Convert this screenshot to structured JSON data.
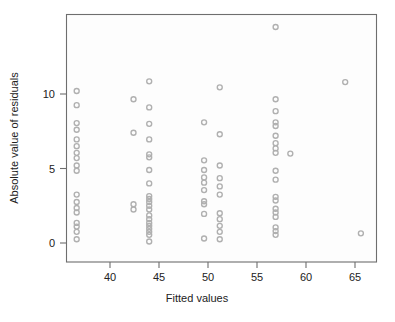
{
  "figure": {
    "title": "",
    "background_color": "#ffffff",
    "plot_background_color": "#fdfdfd",
    "frame_color": "#6e6e6e",
    "point_color": "#b0b0b0"
  },
  "axes": {
    "x_title": "Fitted values",
    "y_title": "Absolute value of residuals",
    "x_ticks": [
      "40",
      "45",
      "50",
      "55",
      "60",
      "65"
    ],
    "y_ticks": [
      "0",
      "5",
      "10"
    ]
  },
  "chart_data": {
    "type": "scatter",
    "title": "",
    "xlabel": "Fitted values",
    "ylabel": "Absolute value of residuals",
    "xticks": [
      40,
      45,
      50,
      55,
      60,
      65
    ],
    "yticks": [
      0,
      5,
      10
    ],
    "xlim": [
      35.8,
      67.6
    ],
    "ylim": [
      -0.6,
      15.0
    ],
    "grid": false,
    "legend": null,
    "marker": "open-circle",
    "marker_color": "#b0b0b0",
    "points": [
      [
        36.6,
        10.2
      ],
      [
        36.6,
        9.25
      ],
      [
        36.6,
        8.05
      ],
      [
        36.6,
        7.6
      ],
      [
        36.6,
        6.95
      ],
      [
        36.6,
        6.5
      ],
      [
        36.6,
        6.05
      ],
      [
        36.6,
        5.7
      ],
      [
        36.6,
        5.2
      ],
      [
        36.6,
        4.85
      ],
      [
        36.6,
        3.25
      ],
      [
        36.6,
        2.75
      ],
      [
        36.6,
        2.35
      ],
      [
        36.6,
        2.05
      ],
      [
        36.6,
        1.35
      ],
      [
        36.6,
        1.1
      ],
      [
        36.6,
        0.75
      ],
      [
        36.6,
        0.25
      ],
      [
        42.4,
        9.65
      ],
      [
        42.4,
        7.4
      ],
      [
        42.4,
        2.6
      ],
      [
        42.4,
        2.25
      ],
      [
        44.0,
        10.85
      ],
      [
        44.0,
        9.1
      ],
      [
        44.0,
        8.0
      ],
      [
        44.0,
        6.95
      ],
      [
        44.0,
        5.95
      ],
      [
        44.0,
        5.75
      ],
      [
        44.0,
        4.9
      ],
      [
        44.0,
        4.0
      ],
      [
        44.0,
        3.15
      ],
      [
        44.0,
        2.95
      ],
      [
        44.0,
        2.75
      ],
      [
        44.0,
        2.5
      ],
      [
        44.0,
        2.25
      ],
      [
        44.0,
        1.85
      ],
      [
        44.0,
        1.6
      ],
      [
        44.0,
        1.35
      ],
      [
        44.0,
        1.15
      ],
      [
        44.0,
        0.95
      ],
      [
        44.0,
        0.75
      ],
      [
        44.0,
        0.55
      ],
      [
        44.0,
        0.1
      ],
      [
        49.6,
        8.1
      ],
      [
        49.6,
        5.55
      ],
      [
        49.6,
        4.9
      ],
      [
        49.6,
        4.4
      ],
      [
        49.6,
        4.05
      ],
      [
        49.6,
        3.55
      ],
      [
        49.6,
        2.8
      ],
      [
        49.6,
        2.6
      ],
      [
        49.6,
        1.95
      ],
      [
        49.6,
        0.3
      ],
      [
        51.2,
        10.45
      ],
      [
        51.2,
        7.3
      ],
      [
        51.2,
        5.2
      ],
      [
        51.2,
        4.35
      ],
      [
        51.2,
        3.8
      ],
      [
        51.2,
        3.25
      ],
      [
        51.2,
        2.0
      ],
      [
        51.2,
        1.6
      ],
      [
        51.2,
        1.15
      ],
      [
        51.2,
        0.75
      ],
      [
        51.2,
        0.25
      ],
      [
        56.9,
        14.5
      ],
      [
        56.9,
        9.65
      ],
      [
        56.9,
        8.85
      ],
      [
        56.9,
        8.1
      ],
      [
        56.9,
        7.85
      ],
      [
        56.9,
        7.2
      ],
      [
        56.9,
        6.7
      ],
      [
        56.9,
        6.35
      ],
      [
        56.9,
        6.05
      ],
      [
        56.9,
        4.85
      ],
      [
        56.9,
        4.25
      ],
      [
        56.9,
        3.1
      ],
      [
        56.9,
        2.85
      ],
      [
        56.9,
        2.3
      ],
      [
        56.9,
        2.05
      ],
      [
        56.9,
        1.75
      ],
      [
        56.9,
        1.05
      ],
      [
        56.9,
        0.8
      ],
      [
        56.9,
        0.55
      ],
      [
        58.4,
        6.0
      ],
      [
        64.0,
        10.8
      ],
      [
        65.6,
        0.65
      ]
    ]
  }
}
